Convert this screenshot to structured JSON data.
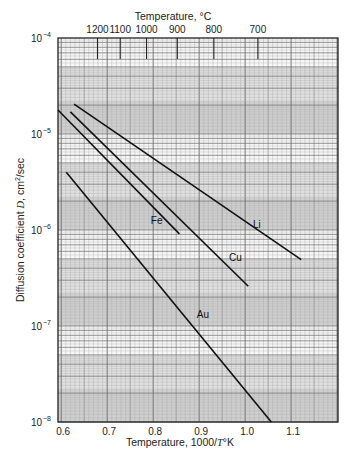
{
  "chart_data": {
    "type": "line",
    "title": "",
    "xlabel": "Temperature, 1000/T°K",
    "xlabel_parts": {
      "prefix": "Temperature, 1000/",
      "italic": "T",
      "suffix": "°K"
    },
    "ylabel": "Diffusion coefficient D, cm²/sec",
    "ylabel_parts": {
      "prefix": "Diffusion coefficient ",
      "italic": "D",
      "mid": ", cm",
      "sup": "2",
      "suffix": "/sec"
    },
    "x2label": "Temperature, °C",
    "xlim": [
      0.593,
      1.202
    ],
    "ylim": [
      1e-08,
      0.0001
    ],
    "yscale": "log",
    "grid": true,
    "x_ticks": [
      0.6,
      0.7,
      0.8,
      0.9,
      1.0,
      1.1
    ],
    "x_tick_labels": [
      "0.6",
      "0.7",
      "0.8",
      "0.9",
      "1.0",
      "1.1"
    ],
    "y_ticks": [
      {
        "value": 0.0001,
        "base": "10",
        "exp": "−4"
      },
      {
        "value": 1e-05,
        "base": "10",
        "exp": "−5"
      },
      {
        "value": 1e-06,
        "base": "10",
        "exp": "−6"
      },
      {
        "value": 1e-07,
        "base": "10",
        "exp": "−7"
      },
      {
        "value": 1e-08,
        "base": "10",
        "exp": "−8"
      }
    ],
    "x2_ticks_celsius": [
      1200,
      1100,
      1000,
      900,
      800,
      700
    ],
    "x2_tick_labels": [
      "1200",
      "1100",
      "1000",
      "900",
      "800",
      "700"
    ],
    "series": [
      {
        "name": "Li",
        "x": [
          0.628,
          1.122
        ],
        "y": [
          2.05e-05,
          4.9e-07
        ],
        "label_at": [
          1.017,
          1.05e-06
        ]
      },
      {
        "name": "Cu",
        "x": [
          0.62,
          1.007
        ],
        "y": [
          1.7e-05,
          2.6e-07
        ],
        "label_at": [
          0.965,
          4.7e-07
        ]
      },
      {
        "name": "Fe",
        "x": [
          0.593,
          0.857
        ],
        "y": [
          1.78e-05,
          9.1e-07
        ],
        "label_at": [
          0.795,
          1.15e-06
        ]
      },
      {
        "name": "Au",
        "x": [
          0.611,
          1.057
        ],
        "y": [
          4e-06,
          1e-08
        ],
        "label_at": [
          0.895,
          1.2e-07
        ]
      }
    ]
  }
}
